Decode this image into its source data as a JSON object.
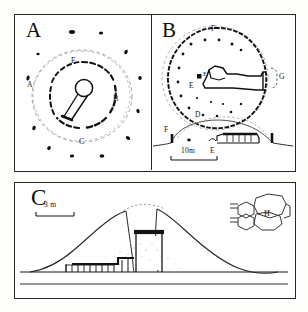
{
  "figure": {
    "title_visible": false,
    "background": "#fdfdfc",
    "ink": "#1a1613"
  },
  "panels": [
    {
      "id": "A",
      "letter": "A",
      "type": "plan",
      "description": "circular monument plan with inner stone ring and central chamber",
      "labels": [
        {
          "key": "A",
          "text": "A",
          "x": 10,
          "y": 66
        },
        {
          "key": "B",
          "text": "B",
          "x": 96,
          "y": 84
        },
        {
          "key": "C",
          "text": "C",
          "x": 64,
          "y": 126
        },
        {
          "key": "F",
          "text": "F",
          "x": 56,
          "y": 44
        }
      ]
    },
    {
      "id": "B",
      "letter": "B",
      "type": "plan",
      "description": "large circular cairn plan with entrance passage and chamber",
      "labels": [
        {
          "key": "F",
          "text": "F",
          "x": 60,
          "y": 12
        },
        {
          "key": "E",
          "text": "E",
          "x": 40,
          "y": 72
        },
        {
          "key": "E2",
          "text": "E",
          "x": 48,
          "y": 62
        },
        {
          "key": "D",
          "text": "D",
          "x": 44,
          "y": 100
        },
        {
          "key": "G",
          "text": "G",
          "x": 124,
          "y": 62
        }
      ],
      "section": {
        "labels": [
          {
            "key": "F",
            "text": "F",
            "x": 8,
            "y": 2
          },
          {
            "key": "E",
            "text": "E",
            "x": 48,
            "y": 32
          }
        ],
        "scale": {
          "label": "10m",
          "length_px": 46
        }
      }
    },
    {
      "id": "C",
      "letter": "C",
      "type": "section",
      "description": "mound cross-section with passage tomb, orthostats and capstones",
      "scale": {
        "label": "3 m",
        "length_px": 38
      },
      "inset": {
        "label": "H",
        "description": "angular rock-art / plan motif"
      }
    }
  ]
}
